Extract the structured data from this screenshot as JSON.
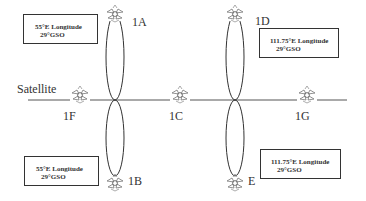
{
  "diagram": {
    "line_label": "Satellite",
    "nodes": {
      "1A": "1A",
      "1B": "1B",
      "1C": "1C",
      "1D": "1D",
      "E": "E",
      "1F": "1F",
      "1G": "1G"
    },
    "boxes": [
      {
        "line1": "55°E Longitude",
        "line2": "29°GSO"
      },
      {
        "line1": "111.75°E Longitude",
        "line2": "29°GSO"
      },
      {
        "line1": "55°E Longitude",
        "line2": "29°GSO"
      },
      {
        "line1": "111.75°E Longitude",
        "line2": "29°GSO"
      }
    ],
    "icon": "satellite-icon"
  }
}
